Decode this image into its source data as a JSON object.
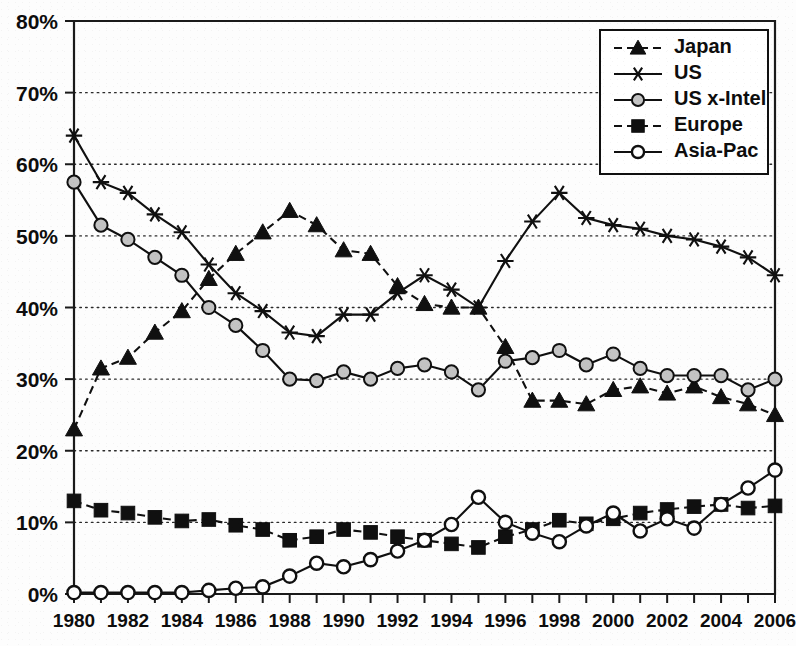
{
  "chart_data": {
    "type": "line",
    "title": "",
    "xlabel": "",
    "ylabel": "",
    "xlim": [
      1980,
      2006
    ],
    "ylim": [
      0,
      80
    ],
    "grid": true,
    "legend_position": "top-right",
    "y_tick_labels": [
      "0%",
      "10%",
      "20%",
      "30%",
      "40%",
      "50%",
      "60%",
      "70%",
      "80%"
    ],
    "y_tick_values": [
      0,
      10,
      20,
      30,
      40,
      50,
      60,
      70,
      80
    ],
    "x_tick_labels": [
      "1980",
      "1982",
      "1984",
      "1986",
      "1988",
      "1990",
      "1992",
      "1994",
      "1996",
      "1998",
      "2000",
      "2002",
      "2004",
      "2006"
    ],
    "x_tick_values": [
      1980,
      1982,
      1984,
      1986,
      1988,
      1990,
      1992,
      1994,
      1996,
      1998,
      2000,
      2002,
      2004,
      2006
    ],
    "x": [
      1980,
      1981,
      1982,
      1983,
      1984,
      1985,
      1986,
      1987,
      1988,
      1989,
      1990,
      1991,
      1992,
      1993,
      1994,
      1995,
      1996,
      1997,
      1998,
      1999,
      2000,
      2001,
      2002,
      2003,
      2004,
      2005,
      2006
    ],
    "series": [
      {
        "name": "Japan",
        "marker": "triangle",
        "marker_fill": "black",
        "line_style": "dashed",
        "values": [
          23.0,
          31.5,
          33.0,
          36.5,
          39.5,
          44.0,
          47.5,
          50.5,
          53.5,
          51.5,
          48.0,
          47.5,
          43.0,
          40.5,
          40.0,
          40.0,
          34.5,
          27.0,
          27.0,
          26.5,
          28.5,
          29.0,
          28.0,
          29.0,
          27.5,
          26.5,
          25.0
        ]
      },
      {
        "name": "US",
        "marker": "star",
        "marker_fill": "none",
        "line_style": "solid",
        "values": [
          64.0,
          57.5,
          56.0,
          53.0,
          50.5,
          46.0,
          42.0,
          39.5,
          36.5,
          36.0,
          39.0,
          39.0,
          42.0,
          44.5,
          42.5,
          40.0,
          46.5,
          52.0,
          56.0,
          52.5,
          51.5,
          51.0,
          50.0,
          49.5,
          48.5,
          47.0,
          44.5
        ]
      },
      {
        "name": "US x-Intel",
        "marker": "circle",
        "marker_fill": "grey",
        "line_style": "solid",
        "values": [
          57.5,
          51.5,
          49.5,
          47.0,
          44.5,
          40.0,
          37.5,
          34.0,
          30.0,
          29.8,
          31.0,
          30.0,
          31.5,
          32.0,
          31.0,
          28.5,
          32.5,
          33.0,
          34.0,
          32.0,
          33.5,
          31.5,
          30.5,
          30.5,
          30.5,
          28.5,
          30.0
        ]
      },
      {
        "name": "Europe",
        "marker": "square",
        "marker_fill": "black",
        "line_style": "dashed",
        "values": [
          13.0,
          11.7,
          11.3,
          10.7,
          10.2,
          10.4,
          9.6,
          9.0,
          7.5,
          8.0,
          9.0,
          8.6,
          8.0,
          7.5,
          7.0,
          6.5,
          8.0,
          9.0,
          10.3,
          9.8,
          10.5,
          11.3,
          11.8,
          12.2,
          12.5,
          12.0,
          12.3
        ]
      },
      {
        "name": "Asia-Pac",
        "marker": "circle",
        "marker_fill": "white",
        "line_style": "solid",
        "values": [
          0.2,
          0.2,
          0.2,
          0.2,
          0.2,
          0.5,
          0.8,
          1.0,
          2.5,
          4.3,
          3.8,
          4.8,
          6.0,
          7.5,
          9.7,
          13.5,
          10.0,
          8.5,
          7.3,
          9.5,
          11.3,
          8.8,
          10.5,
          9.2,
          12.5,
          14.8,
          17.3
        ]
      }
    ]
  },
  "legend": {
    "entries": [
      {
        "label": "Japan"
      },
      {
        "label": "US"
      },
      {
        "label": "US x-Intel"
      },
      {
        "label": "Europe"
      },
      {
        "label": "Asia-Pac"
      }
    ]
  },
  "colors": {
    "ink": "#101010",
    "grid": "#2b2b2b",
    "marker_grey": "#c3c3c3",
    "background": "#fdfdfd"
  }
}
